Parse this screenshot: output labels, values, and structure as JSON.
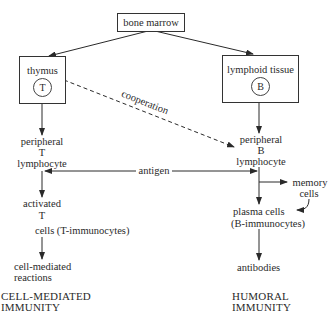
{
  "diagram": {
    "nodes": {
      "bone_marrow": "bone marrow",
      "thymus": {
        "label": "thymus",
        "marker": "T"
      },
      "lymphoid_tissue": {
        "label": "lymphoid tissue",
        "marker": "B"
      },
      "peripheral_t": [
        "peripheral",
        "T",
        "lymphocyte"
      ],
      "peripheral_b": [
        "peripheral",
        "B",
        "lymphocyte"
      ],
      "activated_t": [
        "activated",
        "T",
        "cells (T-immunocytes)"
      ],
      "memory_cells": [
        "memory",
        "cells"
      ],
      "plasma_cells": [
        "plasma cells",
        "(B-immunocytes)"
      ],
      "cell_mediated_reactions": [
        "cell-mediated",
        "reactions"
      ],
      "antibodies": "antibodies"
    },
    "edge_labels": {
      "cooperation": "cooperation",
      "antigen": "antigen"
    },
    "footers": {
      "left": [
        "CELL-MEDIATED",
        "IMMUNITY"
      ],
      "right": [
        "HUMORAL",
        "IMMUNITY"
      ]
    },
    "colors": {
      "line": "#2a2a2a",
      "background": "#ffffff"
    }
  }
}
